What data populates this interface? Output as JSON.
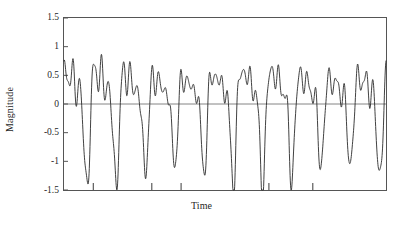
{
  "chart_data": {
    "type": "line",
    "title": "",
    "xlabel": "Time",
    "ylabel": "Magnitude",
    "xlim": [
      0,
      11
    ],
    "ylim": [
      -1.5,
      1.5
    ],
    "grid": false,
    "legend": null,
    "zero_line": true,
    "y_ticks": [
      1.5,
      1,
      0.5,
      0,
      -0.5,
      -1,
      -1.5
    ],
    "y_tick_labels": [
      "1.5",
      "1",
      "0.5",
      "0",
      "-0.5",
      "-1",
      "-1.5"
    ],
    "x_ticks": [
      1,
      3,
      4,
      7,
      8.5
    ],
    "x_tick_labels": [
      "",
      "",
      "",
      "",
      ""
    ],
    "line_color": "#2b2b2b",
    "line_width": 0.9,
    "axis_color": "#555555",
    "zero_line_color": "#777777",
    "n_points": 1400,
    "series": [
      {
        "name": "magnitude",
        "formula_terms": [
          {
            "amplitude": 0.78,
            "frequency": 11.0,
            "phase": 0.0
          },
          {
            "amplitude": 0.46,
            "frequency": 22.0,
            "phase": 1.15
          },
          {
            "amplitude": 0.3,
            "frequency": 33.0,
            "phase": 2.3
          },
          {
            "amplitude": 0.17,
            "frequency": 45.0,
            "phase": 0.6
          },
          {
            "amplitude": 0.1,
            "frequency": 57.0,
            "phase": 3.0
          },
          {
            "amplitude": 0.07,
            "frequency": 69.0,
            "phase": 1.8
          }
        ],
        "envelope": {
          "base": 0.86,
          "amplitude": 0.14,
          "frequency": 2.0,
          "phase": 0.4
        },
        "peak_positive_range": [
          1.0,
          1.47
        ],
        "peak_negative_range": [
          -1.47,
          -0.8
        ],
        "approx_burst_count": 11
      }
    ]
  },
  "axis": {
    "y_label": "Magnitude",
    "x_label": "Time",
    "tick_1_5": "1.5",
    "tick_1": "1",
    "tick_0_5": "0.5",
    "tick_0": "0",
    "tick_neg_0_5": "-0.5",
    "tick_neg_1": "-1",
    "tick_neg_1_5": "-1.5"
  }
}
